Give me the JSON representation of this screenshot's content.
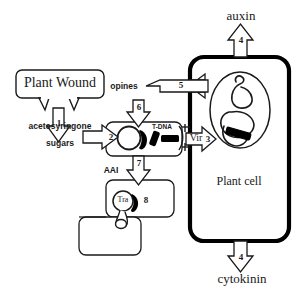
{
  "diagram": {
    "title_alt": "Agrobacterium tumefaciens T-DNA transfer to plant cell",
    "colors": {
      "stroke": "#1a1a1a",
      "thick_stroke": "#000000",
      "fill": "#ffffff",
      "dna_black": "#000000"
    }
  },
  "labels": {
    "plant_wound": "Plant Wound",
    "acetosyringone": "acetosyringone",
    "sugars": "sugars",
    "opines": "opines",
    "t_dna": "T-DNA",
    "vir": "Vir",
    "aai": "AAI",
    "tra": "Tra",
    "auxin": "auxin",
    "cytokinin": "cytokinin",
    "plant_cell": "Plant cell"
  },
  "steps": [
    {
      "id": "1",
      "label": "1",
      "meaning": "wound releases signal molecules"
    },
    {
      "id": "2",
      "label": "2",
      "meaning": "signals perceived by bacterium"
    },
    {
      "id": "3",
      "label": "3",
      "meaning": "T-DNA transfer into plant cell"
    },
    {
      "id": "4a",
      "label": "4",
      "meaning": "auxin production"
    },
    {
      "id": "5",
      "label": "5",
      "meaning": "opines released from plant cell"
    },
    {
      "id": "6",
      "label": "6",
      "meaning": "opine uptake by bacterium"
    },
    {
      "id": "7",
      "label": "7",
      "meaning": "AAI signal to second bacterium"
    },
    {
      "id": "8",
      "label": "8",
      "meaning": "Tra conjugative transfer"
    },
    {
      "id": "4b",
      "label": "4",
      "meaning": "cytokinin production"
    }
  ]
}
